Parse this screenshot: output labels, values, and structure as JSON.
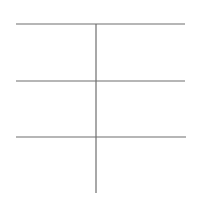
{
  "diagram": {
    "type": "t-chart-grid",
    "line_color": "#6e6e6e",
    "background": "#ffffff",
    "horizontal_lines": [
      {
        "x1": 16,
        "x2": 185,
        "y": 24
      },
      {
        "x1": 16,
        "x2": 185,
        "y": 81
      },
      {
        "x1": 16,
        "x2": 186,
        "y": 137
      }
    ],
    "vertical_lines": [
      {
        "x": 96,
        "y1": 24,
        "y2": 193
      }
    ]
  }
}
